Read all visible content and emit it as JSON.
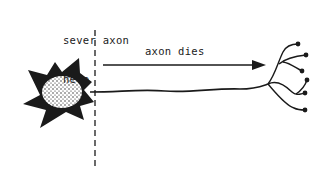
{
  "diagram": {
    "labels": {
      "sever_line1": "sever axon",
      "sever_line2": "here",
      "axon_dies": "axon dies"
    },
    "elements": {
      "cell_body": "neuron-soma",
      "cut_line": "dashed-sever-line",
      "arrow": "degeneration-direction-arrow",
      "axon": "axon",
      "terminals": "axon-terminals"
    },
    "colors": {
      "ink": "#1a1a1a",
      "background": "#ffffff"
    }
  }
}
